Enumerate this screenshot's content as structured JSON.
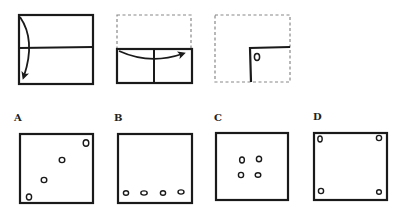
{
  "puzzle": {
    "type": "paper-folding-hole-punch",
    "steps": [
      {
        "id": "step-1",
        "description": "Square paper folded top half down along horizontal center line"
      },
      {
        "id": "step-2",
        "description": "Folded rectangle folded left half over to the right along vertical center line"
      },
      {
        "id": "step-3",
        "description": "Quarter-sized folded paper punched with one hole near the inner corner"
      }
    ],
    "options": [
      {
        "label": "A",
        "holes": "four holes along a diagonal from bottom-left to top-right"
      },
      {
        "label": "B",
        "holes": "four holes in a row along the bottom edge"
      },
      {
        "label": "C",
        "holes": "four holes clustered in a 2x2 grid at the center"
      },
      {
        "label": "D",
        "holes": "four holes, one in each corner"
      }
    ]
  },
  "colors": {
    "ink": "#1a1a1a",
    "dashed": "#777777",
    "background": "#ffffff"
  }
}
